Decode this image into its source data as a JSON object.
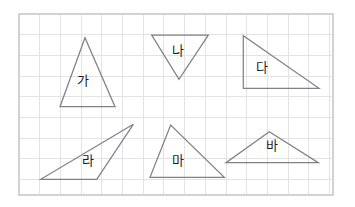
{
  "page": {
    "width": 355,
    "height": 207,
    "background_color": "#ffffff"
  },
  "grid": {
    "name": "grid-paper",
    "x": 19,
    "y": 14,
    "width": 314,
    "height": 181,
    "cell_size": 20.7,
    "line_color": "#e3e3e6",
    "frame_color": "#d2d2d6",
    "columns": 16,
    "rows": 9
  },
  "figure_style": {
    "stroke_color": "#818186",
    "stroke_width": 1.25,
    "fill": "none",
    "label_color": "#1c1c1c",
    "label_font_size": 13
  },
  "shapes": [
    {
      "id": "triangle-ga",
      "label": "가",
      "kind": "triangle",
      "description": "acute isosceles triangle, apex up",
      "points": "85,37.7 60,106.7 115,106.7",
      "label_x": 83,
      "label_y": 80
    },
    {
      "id": "triangle-na",
      "label": "나",
      "kind": "triangle",
      "description": "isosceles triangle, apex down",
      "points": "151.7,35 208.3,35 179,79.3",
      "label_x": 178,
      "label_y": 50
    },
    {
      "id": "triangle-da",
      "label": "다",
      "kind": "triangle",
      "description": "right triangle, right angle at bottom-left",
      "points": "243.3,35.7 243.3,88.3 319,88.3",
      "label_x": 262,
      "label_y": 67
    },
    {
      "id": "triangle-ra",
      "label": "라",
      "kind": "triangle",
      "description": "obtuse scalene triangle, apex at upper right",
      "points": "133.3,124.3 40.7,179.3 96.7,179.3",
      "label_x": 88,
      "label_y": 160
    },
    {
      "id": "triangle-ma",
      "label": "마",
      "kind": "triangle",
      "description": "scalene triangle, apex up left of center",
      "points": "170.7,125 150,177.3 224.3,177.3",
      "label_x": 178,
      "label_y": 160
    },
    {
      "id": "triangle-ba",
      "label": "바",
      "kind": "triangle",
      "description": "wide obtuse triangle, apex up",
      "points": "269.3,131.7 226,162.7 318.3,162.7",
      "label_x": 272,
      "label_y": 145
    }
  ]
}
